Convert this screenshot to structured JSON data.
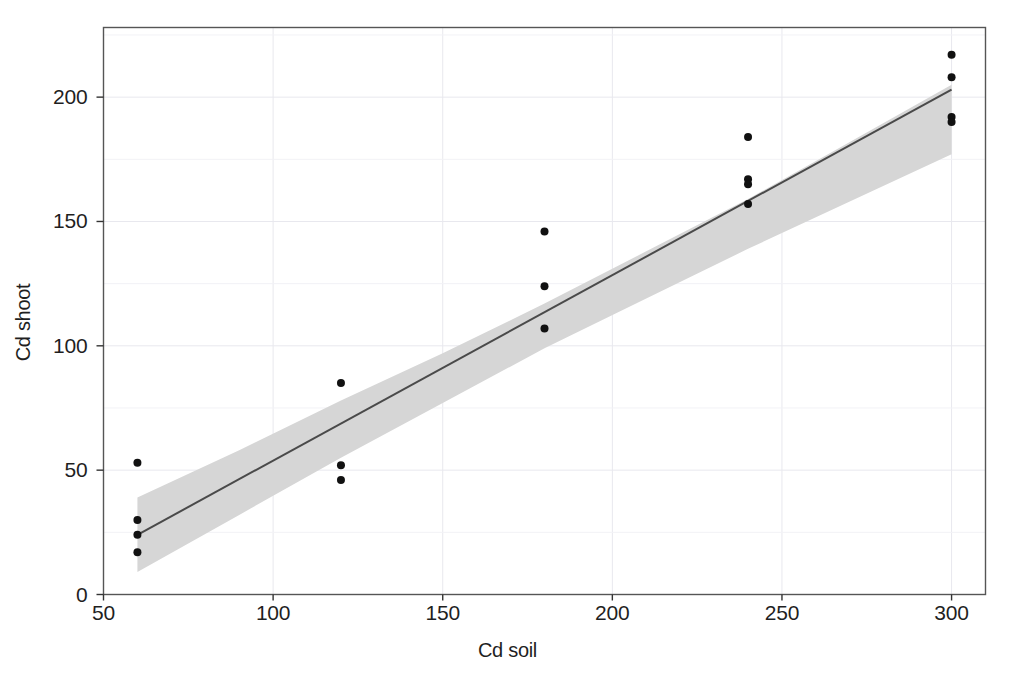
{
  "chart_data": {
    "type": "scatter",
    "title": "",
    "xlabel": "Cd soil",
    "ylabel": "Cd shoot",
    "xlim": [
      50,
      310
    ],
    "ylim": [
      0,
      228
    ],
    "xticks": [
      50,
      100,
      150,
      200,
      250,
      300
    ],
    "yticks": [
      0,
      50,
      100,
      150,
      200
    ],
    "xticklabels": [
      "50",
      "100",
      "150",
      "200",
      "250",
      "300"
    ],
    "yticklabels": [
      "0",
      "50",
      "100",
      "150",
      "200"
    ],
    "grid": true,
    "grid_color": "#e8e8ee",
    "legend": "none",
    "marker_color": "#111111",
    "marker_size": 4,
    "line_color": "#4a4a4a",
    "band_color": "#d6d6d6",
    "frame_color": "#555555",
    "background": "#ffffff",
    "points": [
      {
        "x": 60,
        "y": 53
      },
      {
        "x": 60,
        "y": 30
      },
      {
        "x": 60,
        "y": 24
      },
      {
        "x": 60,
        "y": 17
      },
      {
        "x": 120,
        "y": 85
      },
      {
        "x": 120,
        "y": 52
      },
      {
        "x": 120,
        "y": 46
      },
      {
        "x": 180,
        "y": 146
      },
      {
        "x": 180,
        "y": 124
      },
      {
        "x": 180,
        "y": 107
      },
      {
        "x": 240,
        "y": 184
      },
      {
        "x": 240,
        "y": 167
      },
      {
        "x": 240,
        "y": 165
      },
      {
        "x": 240,
        "y": 157
      },
      {
        "x": 300,
        "y": 217
      },
      {
        "x": 300,
        "y": 208
      },
      {
        "x": 300,
        "y": 192
      },
      {
        "x": 300,
        "y": 190
      }
    ],
    "series": [
      {
        "name": "regression fit",
        "type": "line",
        "x": [
          60,
          300
        ],
        "y": [
          24,
          203
        ]
      },
      {
        "name": "confidence band",
        "type": "area",
        "x": [
          60,
          90,
          120,
          150,
          180,
          210,
          240,
          270,
          300
        ],
        "y_lower": [
          9,
          32,
          55,
          77,
          99,
          119,
          139,
          158,
          177
        ],
        "y_upper": [
          39,
          58,
          78,
          97,
          117,
          138,
          159,
          182,
          205
        ]
      }
    ]
  }
}
